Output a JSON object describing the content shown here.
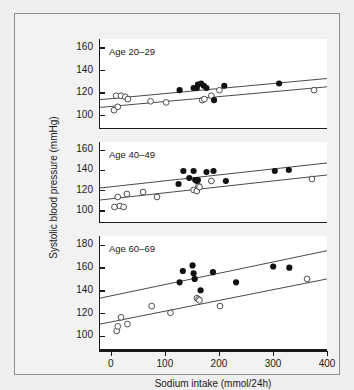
{
  "figure": {
    "xlabel": "Sodium intake (mmol/24h)",
    "ylabel": "Systolic blood pressure (mmHg)"
  },
  "chart_data": {
    "type": "scatter",
    "title": "",
    "xlabel": "Sodium intake (mmol/24h)",
    "ylabel": "Systolic blood pressure (mmHg)",
    "xlim": [
      -22,
      400
    ],
    "xticks": [
      0,
      100,
      200,
      300,
      400
    ],
    "grid": false,
    "legend": null,
    "marker_styles": {
      "filled": "filled black circle",
      "open": "open circle with black outline"
    },
    "panels": [
      {
        "label": "Age 20–29",
        "ylim": [
          88,
          168
        ],
        "yticks": [
          100,
          120,
          140,
          160
        ],
        "series": [
          {
            "name": "filled",
            "marker": "filled",
            "points": [
              [
                126,
                122
              ],
              [
                152,
                124
              ],
              [
                158,
                124
              ],
              [
                160,
                127
              ],
              [
                166,
                128
              ],
              [
                171,
                126
              ],
              [
                176,
                124
              ],
              [
                190,
                113
              ],
              [
                209,
                126
              ],
              [
                311,
                128
              ]
            ]
          },
          {
            "name": "open",
            "marker": "open",
            "points": [
              [
                4,
                104
              ],
              [
                8,
                117
              ],
              [
                11,
                107
              ],
              [
                17,
                117
              ],
              [
                25,
                116
              ],
              [
                30,
                114
              ],
              [
                72,
                112
              ],
              [
                101,
                111
              ],
              [
                168,
                113
              ],
              [
                172,
                114
              ],
              [
                185,
                117
              ],
              [
                200,
                122
              ],
              [
                376,
                122
              ]
            ]
          }
        ],
        "fit_lines": [
          {
            "name": "filled-fit",
            "x": [
              -22,
              400
            ],
            "y": [
              113.5,
              132.5
            ]
          },
          {
            "name": "open-fit",
            "x": [
              -22,
              400
            ],
            "y": [
              106.5,
              125.0
            ]
          }
        ]
      },
      {
        "label": "Age 40–49",
        "ylim": [
          88,
          168
        ],
        "yticks": [
          100,
          120,
          140,
          160
        ],
        "series": [
          {
            "name": "filled",
            "marker": "filled",
            "points": [
              [
                124,
                126
              ],
              [
                133,
                139
              ],
              [
                144,
                132
              ],
              [
                152,
                139
              ],
              [
                155,
                130
              ],
              [
                158,
                129
              ],
              [
                160,
                130
              ],
              [
                176,
                138
              ],
              [
                189,
                139
              ],
              [
                212,
                129
              ],
              [
                303,
                139
              ],
              [
                329,
                140
              ]
            ]
          },
          {
            "name": "open",
            "marker": "open",
            "points": [
              [
                5,
                103
              ],
              [
                11,
                113
              ],
              [
                15,
                104
              ],
              [
                22,
                103
              ],
              [
                28,
                116
              ],
              [
                58,
                118
              ],
              [
                84,
                113
              ],
              [
                152,
                120
              ],
              [
                158,
                119
              ],
              [
                161,
                124
              ],
              [
                163,
                123
              ],
              [
                185,
                129
              ],
              [
                372,
                131
              ]
            ]
          }
        ],
        "fit_lines": [
          {
            "name": "filled-fit",
            "x": [
              -22,
              400
            ],
            "y": [
              122.0,
              147.0
            ]
          },
          {
            "name": "open-fit",
            "x": [
              -22,
              400
            ],
            "y": [
              110.0,
              135.0
            ]
          }
        ]
      },
      {
        "label": "Age 60–69",
        "ylim": [
          88,
          188
        ],
        "yticks": [
          100,
          120,
          140,
          160,
          180
        ],
        "series": [
          {
            "name": "filled",
            "marker": "filled",
            "points": [
              [
                126,
                147
              ],
              [
                132,
                157
              ],
              [
                150,
                162
              ],
              [
                152,
                155
              ],
              [
                154,
                150
              ],
              [
                165,
                140
              ],
              [
                188,
                156
              ],
              [
                231,
                147
              ],
              [
                300,
                161
              ],
              [
                330,
                160
              ]
            ]
          },
          {
            "name": "open",
            "marker": "open",
            "points": [
              [
                9,
                104
              ],
              [
                11,
                108
              ],
              [
                17,
                116
              ],
              [
                29,
                110
              ],
              [
                74,
                126
              ],
              [
                109,
                120
              ],
              [
                158,
                133
              ],
              [
                161,
                132
              ],
              [
                163,
                131
              ],
              [
                201,
                126
              ],
              [
                363,
                150
              ]
            ]
          }
        ],
        "fit_lines": [
          {
            "name": "filled-fit",
            "x": [
              -22,
              400
            ],
            "y": [
              133.0,
              175.0
            ]
          },
          {
            "name": "open-fit",
            "x": [
              -22,
              400
            ],
            "y": [
              110.0,
              150.0
            ]
          }
        ]
      }
    ]
  }
}
